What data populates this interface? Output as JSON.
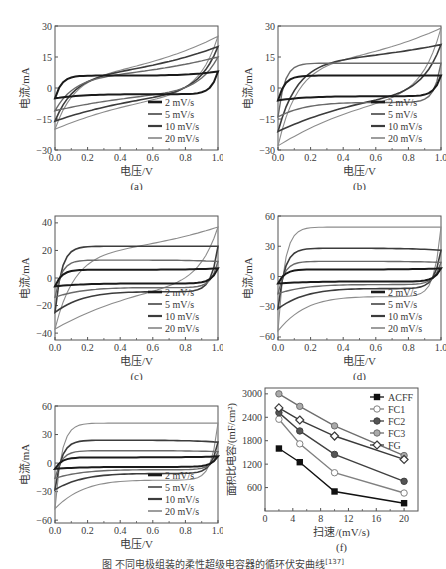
{
  "figure": {
    "caption": "图 不同电极组装的柔性超级电容器的循环伏安曲线",
    "caption_ref": "[137]"
  },
  "chart_data": [
    {
      "id": "a",
      "type": "line",
      "panel_label": "(a)",
      "xlabel": "电压/V",
      "ylabel": "电流/mA",
      "xlim": [
        0.0,
        1.0
      ],
      "ylim": [
        -30,
        30
      ],
      "xticks": [
        "0.0",
        "0.2",
        "0.4",
        "0.6",
        "0.8",
        "1.0"
      ],
      "yticks": [
        -30,
        -15,
        0,
        15,
        30
      ],
      "legend": [
        "2 mV/s",
        "5 mV/s",
        "10 mV/s",
        "20 mV/s"
      ],
      "legend_position": "lower right",
      "series": [
        {
          "name": "2 mV/s",
          "v_min_current": -5,
          "v_max_current": 8,
          "upper_plateau": 6,
          "lower_plateau": -3,
          "style": "rect"
        },
        {
          "name": "5 mV/s",
          "v_min_current": -11,
          "v_max_current": 15,
          "upper_plateau": 9,
          "lower_plateau": -6,
          "style": "slant"
        },
        {
          "name": "10 mV/s",
          "v_min_current": -16,
          "v_max_current": 20,
          "upper_plateau": 11,
          "lower_plateau": -8,
          "style": "slant"
        },
        {
          "name": "20 mV/s",
          "v_min_current": -20,
          "v_max_current": 25,
          "upper_plateau": 12,
          "lower_plateau": -10,
          "style": "slant"
        }
      ]
    },
    {
      "id": "b",
      "type": "line",
      "panel_label": "(b)",
      "xlabel": "电压/V",
      "ylabel": "电流/mA",
      "xlim": [
        0.0,
        1.0
      ],
      "ylim": [
        -30,
        30
      ],
      "xticks": [
        "0.0",
        "0.2",
        "0.4",
        "0.6",
        "0.8",
        "1.0"
      ],
      "yticks": [
        -30,
        -15,
        0,
        15,
        30
      ],
      "legend": [
        "2 mV/s",
        "5 mV/s",
        "10 mV/s",
        "20 mV/s"
      ],
      "legend_position": "lower right",
      "series": [
        {
          "name": "2 mV/s",
          "v_min_current": -6,
          "v_max_current": 6,
          "upper_plateau": 6,
          "lower_plateau": -4,
          "style": "rect"
        },
        {
          "name": "5 mV/s",
          "v_min_current": -14,
          "v_max_current": 12,
          "upper_plateau": 12,
          "lower_plateau": -7,
          "style": "rect"
        },
        {
          "name": "10 mV/s",
          "v_min_current": -21,
          "v_max_current": 21,
          "upper_plateau": 20,
          "lower_plateau": -9,
          "style": "slant"
        },
        {
          "name": "20 mV/s",
          "v_min_current": -28,
          "v_max_current": 29,
          "upper_plateau": 20,
          "lower_plateau": -12,
          "style": "slant"
        }
      ]
    },
    {
      "id": "c",
      "type": "line",
      "panel_label": "(c)",
      "xlabel": "电压/V",
      "ylabel": "电流/mA",
      "xlim": [
        0.0,
        1.0
      ],
      "ylim": [
        -45,
        45
      ],
      "xticks": [
        "0.0",
        "0.2",
        "0.4",
        "0.6",
        "0.8",
        "1.0"
      ],
      "yticks": [
        -40,
        -20,
        0,
        20,
        40
      ],
      "legend": [
        "2 mV/s",
        "5 mV/s",
        "10 mV/s",
        "20 mV/s"
      ],
      "legend_position": "lower right",
      "series": [
        {
          "name": "2 mV/s",
          "v_min_current": -6,
          "v_max_current": 7,
          "upper_plateau": 6,
          "lower_plateau": -4,
          "style": "rect"
        },
        {
          "name": "5 mV/s",
          "v_min_current": -14,
          "v_max_current": 12,
          "upper_plateau": 13,
          "lower_plateau": -7,
          "style": "rect"
        },
        {
          "name": "10 mV/s",
          "v_min_current": -25,
          "v_max_current": 23,
          "upper_plateau": 23,
          "lower_plateau": -10,
          "style": "rect"
        },
        {
          "name": "20 mV/s",
          "v_min_current": -37,
          "v_max_current": 37,
          "upper_plateau": 30,
          "lower_plateau": -15,
          "style": "slant"
        }
      ]
    },
    {
      "id": "d",
      "type": "line",
      "panel_label": "(d)",
      "xlabel": "电压/V",
      "ylabel": "电流/mA",
      "xlim": [
        0.0,
        1.0
      ],
      "ylim": [
        -63,
        60
      ],
      "xticks": [
        "0.0",
        "0.2",
        "0.4",
        "0.6",
        "0.8",
        "1.0"
      ],
      "yticks": [
        -60,
        -30,
        0,
        30,
        60
      ],
      "legend": [
        "2 mV/s",
        "5 mV/s",
        "10 mV/s",
        "20 mV/s"
      ],
      "legend_position": "lower right",
      "series": [
        {
          "name": "2 mV/s",
          "v_min_current": -7,
          "v_max_current": 8,
          "upper_plateau": 7,
          "lower_plateau": -5,
          "style": "rect"
        },
        {
          "name": "5 mV/s",
          "v_min_current": -17,
          "v_max_current": 14,
          "upper_plateau": 15,
          "lower_plateau": -8,
          "style": "rect"
        },
        {
          "name": "10 mV/s",
          "v_min_current": -32,
          "v_max_current": 26,
          "upper_plateau": 28,
          "lower_plateau": -12,
          "style": "rect"
        },
        {
          "name": "20 mV/s",
          "v_min_current": -54,
          "v_max_current": 49,
          "upper_plateau": 49,
          "lower_plateau": -20,
          "style": "rect"
        }
      ]
    },
    {
      "id": "e",
      "type": "line",
      "panel_label": "(e)",
      "xlabel": "电压/V",
      "ylabel": "电流/mA",
      "xlim": [
        0.0,
        1.0
      ],
      "ylim": [
        -63,
        60
      ],
      "xticks": [
        "0.0",
        "0.2",
        "0.4",
        "0.6",
        "0.8",
        "1.0"
      ],
      "yticks": [
        -60,
        -30,
        0,
        30,
        60
      ],
      "legend": [
        "2 mV/s",
        "5 mV/s",
        "10 mV/s",
        "20 mV/s"
      ],
      "legend_position": "lower right",
      "series": [
        {
          "name": "2 mV/s",
          "v_min_current": -6,
          "v_max_current": 7,
          "upper_plateau": 6,
          "lower_plateau": -4,
          "style": "rect"
        },
        {
          "name": "5 mV/s",
          "v_min_current": -16,
          "v_max_current": 12,
          "upper_plateau": 13,
          "lower_plateau": -7,
          "style": "rect"
        },
        {
          "name": "10 mV/s",
          "v_min_current": -28,
          "v_max_current": 22,
          "upper_plateau": 24,
          "lower_plateau": -11,
          "style": "rect"
        },
        {
          "name": "20 mV/s",
          "v_min_current": -48,
          "v_max_current": 42,
          "upper_plateau": 42,
          "lower_plateau": -18,
          "style": "rect"
        }
      ]
    },
    {
      "id": "f",
      "type": "line",
      "panel_label": "(f)",
      "xlabel": "扫速/(mV/s)",
      "ylabel": "面积比电容/(mF/cm²)",
      "xlim": [
        0,
        22
      ],
      "ylim": [
        0,
        3150
      ],
      "xticks": [
        0,
        4,
        8,
        12,
        16,
        20
      ],
      "yticks": [
        600,
        1200,
        1800,
        2400,
        3000
      ],
      "legend_position": "upper right",
      "x": [
        2,
        5,
        10,
        20
      ],
      "series": [
        {
          "name": "ACFF",
          "marker": "square-filled",
          "values": [
            1600,
            1250,
            500,
            200
          ]
        },
        {
          "name": "FC1",
          "marker": "circle-open",
          "values": [
            2350,
            1720,
            980,
            460
          ]
        },
        {
          "name": "FC2",
          "marker": "circle-filled",
          "values": [
            2520,
            2050,
            1450,
            760
          ]
        },
        {
          "name": "FC3",
          "marker": "circle-gray",
          "values": [
            3000,
            2680,
            2180,
            1420
          ]
        },
        {
          "name": "FG",
          "marker": "diamond-open",
          "values": [
            2640,
            2330,
            1920,
            1320
          ]
        }
      ]
    }
  ],
  "style": {
    "cv_colors": [
      "#1a1a1a",
      "#6a6a6a",
      "#3c3c3c",
      "#8c8c8c"
    ],
    "cv_widths": [
      2.0,
      1.4,
      1.6,
      1.1
    ],
    "f_colors": {
      "ACFF": "#111111",
      "FC1": "#808080",
      "FC2": "#404040",
      "FC3": "#6e6e6e",
      "FG": "#3a3a3a"
    },
    "frame": "#555555"
  }
}
